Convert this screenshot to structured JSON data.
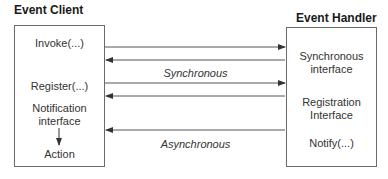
{
  "client": {
    "title": "Event Client",
    "items": [
      "Invoke(...)",
      "Register(...)",
      "Notification",
      "interface",
      "Action"
    ]
  },
  "handler": {
    "title": "Event Handler",
    "items": [
      "Synchronous",
      "interface",
      "Registration",
      "Interface",
      "Notify(...)"
    ]
  },
  "labels": {
    "synchronous": "Synchronous",
    "asynchronous": "Asynchronous"
  }
}
